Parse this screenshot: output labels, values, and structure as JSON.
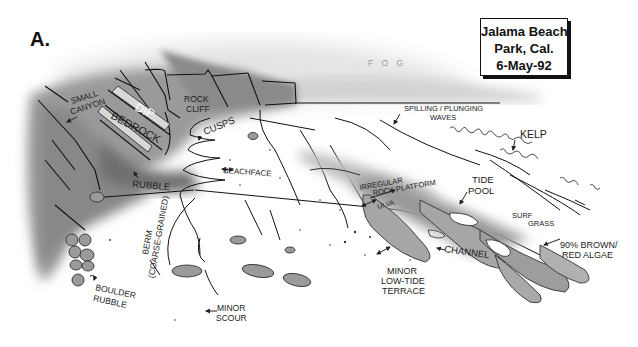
{
  "figure": {
    "panel_label": "A.",
    "title_box": {
      "line1": "Jalama Beach",
      "line2": "Park, Cal.",
      "line3": "6-May-92"
    },
    "colors": {
      "ink": "#111111",
      "cliff_gray": "#8c8c8c",
      "platform_gray": "#9a9a9a",
      "fog_gray": "#d8d8d8",
      "background": "#ffffff"
    },
    "labels": {
      "fog": "F O G",
      "small_canyon_1": "SMALL",
      "small_canyon_2": "CANYON",
      "dip": "DIP",
      "bedrock": "BEDROCK",
      "rock_cliff_1": "ROCK",
      "rock_cliff_2": "CLIFF",
      "cusps": "CUSPS",
      "beachface": "BEACHFACE",
      "rubble": "RUBBLE",
      "berm_1": "BERM",
      "berm_2": "(COARSE-GRAINED)",
      "boulder_rubble_1": "BOULDER",
      "boulder_rubble_2": "RUBBLE",
      "minor_scour_1": "MINOR",
      "minor_scour_2": "SCOUR",
      "waves_1": "SPILLING / PLUNGING",
      "waves_2": "WAVES",
      "kelp": "KELP",
      "tide_pool_1": "TIDE",
      "tide_pool_2": "POOL",
      "rock_platform_1": "IRREGULAR",
      "rock_platform_2": "ROCK PLATFORM",
      "ulva": "ULVA",
      "surf_grass_1": "SURF",
      "surf_grass_2": "GRASS",
      "channel": "CHANNEL",
      "terrace_1": "MINOR",
      "terrace_2": "LOW-TIDE",
      "terrace_3": "TERRACE",
      "algae_1": "90% BROWN/",
      "algae_2": "RED ALGAE"
    }
  }
}
